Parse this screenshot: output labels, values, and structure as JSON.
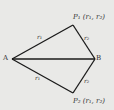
{
  "diagram": {
    "points": {
      "A": {
        "label": "A",
        "x": 12,
        "y": 59
      },
      "B": {
        "label": "B",
        "x": 95,
        "y": 59
      },
      "P1": {
        "label": "P₁ (r₁, r₂)",
        "x": 73,
        "y": 25
      },
      "P2": {
        "label": "P₂ (r₁, r₂)",
        "x": 73,
        "y": 93
      }
    },
    "edges": [
      {
        "from": "A",
        "to": "P1",
        "label": "r₁"
      },
      {
        "from": "P1",
        "to": "B",
        "label": "r₂"
      },
      {
        "from": "A",
        "to": "B",
        "label": ""
      },
      {
        "from": "A",
        "to": "P2",
        "label": "r₁"
      },
      {
        "from": "P2",
        "to": "B",
        "label": "r₂"
      }
    ],
    "colors": {
      "background": "#e9e9e7",
      "line": "#1a1a1a"
    }
  }
}
